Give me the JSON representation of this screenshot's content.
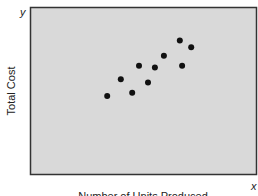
{
  "chart_data": {
    "type": "scatter",
    "title": "",
    "xlabel": "Number of Units Produced",
    "ylabel": "Total Cost",
    "x_axis_symbol": "x",
    "y_axis_symbol": "y",
    "xlim": [
      0,
      10
    ],
    "ylim": [
      0,
      10
    ],
    "grid": false,
    "ticks": false,
    "legend": null,
    "background_color": "#d9d9d9",
    "frame_color": "#333333",
    "marker_color": "#111111",
    "points": [
      {
        "x": 3.4,
        "y": 4.7
      },
      {
        "x": 4.0,
        "y": 5.7
      },
      {
        "x": 4.5,
        "y": 4.9
      },
      {
        "x": 4.8,
        "y": 6.5
      },
      {
        "x": 5.2,
        "y": 5.5
      },
      {
        "x": 5.5,
        "y": 6.4
      },
      {
        "x": 5.9,
        "y": 7.1
      },
      {
        "x": 6.6,
        "y": 8.0
      },
      {
        "x": 6.7,
        "y": 6.5
      },
      {
        "x": 7.1,
        "y": 7.6
      }
    ]
  }
}
